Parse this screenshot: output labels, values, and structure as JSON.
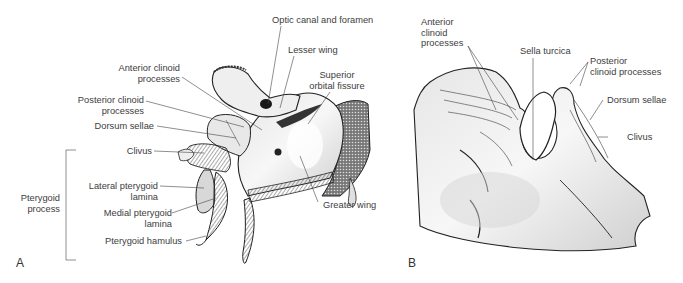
{
  "figure": {
    "panels": [
      {
        "letter": "A",
        "labels": {
          "optic_canal": "Optic canal and foramen",
          "lesser_wing": "Lesser wing",
          "superior_orbital_1": "Superior",
          "superior_orbital_2": "orbital fissure",
          "anterior_clinoid_1": "Anterior clinoid",
          "anterior_clinoid_2": "processes",
          "posterior_clinoid_1": "Posterior clinoid",
          "posterior_clinoid_2": "processes",
          "dorsum_sellae": "Dorsum sellae",
          "clivus": "Clivus",
          "pterygoid_process_1": "Pterygoid",
          "pterygoid_process_2": "process",
          "lateral_pterygoid_1": "Lateral pterygoid",
          "lateral_pterygoid_2": "lamina",
          "medial_pterygoid_1": "Medial pterygoid",
          "medial_pterygoid_2": "lamina",
          "pterygoid_hamulus": "Pterygoid hamulus",
          "greater_wing": "Greater wing"
        }
      },
      {
        "letter": "B",
        "labels": {
          "anterior_clinoid_1": "Anterior",
          "anterior_clinoid_2": "clinoid",
          "anterior_clinoid_3": "processes",
          "sella_turcica": "Sella turcica",
          "posterior_clinoid_1": "Posterior",
          "posterior_clinoid_2": "clinoid processes",
          "dorsum_sellae": "Dorsum sellae",
          "clivus": "Clivus"
        }
      }
    ]
  }
}
